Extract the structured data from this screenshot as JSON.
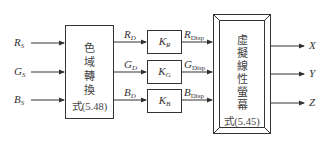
{
  "diagram": {
    "inputs": [
      {
        "symbol": "R",
        "sub": "S"
      },
      {
        "symbol": "G",
        "sub": "S"
      },
      {
        "symbol": "B",
        "sub": "S"
      }
    ],
    "gamut_block": {
      "title_chars": [
        "色",
        "域",
        "轉",
        "換"
      ],
      "equation": "式(5.48)"
    },
    "drive_signals": [
      {
        "symbol": "R",
        "sub": "D"
      },
      {
        "symbol": "G",
        "sub": "D"
      },
      {
        "symbol": "B",
        "sub": "D"
      }
    ],
    "gain_blocks": [
      {
        "symbol": "K",
        "sub": "R"
      },
      {
        "symbol": "K",
        "sub": "G"
      },
      {
        "symbol": "K",
        "sub": "B"
      }
    ],
    "display_signals": [
      {
        "symbol": "R",
        "sub": "Disp"
      },
      {
        "symbol": "G",
        "sub": "Disp"
      },
      {
        "symbol": "B",
        "sub": "Disp"
      }
    ],
    "screen_block": {
      "title_chars": [
        "虛",
        "擬",
        "線",
        "性",
        "螢",
        "幕"
      ],
      "equation": "式(5.45)"
    },
    "outputs": [
      "X",
      "Y",
      "Z"
    ],
    "colors": {
      "line": "#333333",
      "background": "#ffffff"
    }
  }
}
